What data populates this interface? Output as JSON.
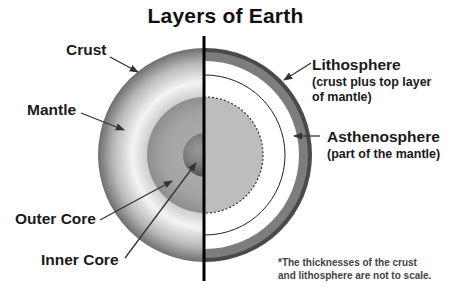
{
  "title": "Layers of Earth",
  "left_labels": {
    "crust": "Crust",
    "mantle": "Mantle",
    "outer_core": "Outer Core",
    "inner_core": "Inner Core"
  },
  "right_labels": {
    "lithosphere": {
      "name": "Lithosphere",
      "desc_line1": "(crust plus top layer",
      "desc_line2": "of mantle)"
    },
    "asthenosphere": {
      "name": "Asthenosphere",
      "desc": "(part of the mantle)"
    }
  },
  "footnote": {
    "line1": "*The thicknesses of the crust",
    "line2": "and lithosphere are not to scale."
  },
  "colors": {
    "background": "#ffffff",
    "text": "#1a1a1a",
    "divider": "#000000",
    "mantle_light": "#f2f2f2",
    "mantle_dark": "#6a6a6a",
    "outer_core": "#a6a6a6",
    "inner_core": "#7a7a7a",
    "lithosphere_band": "#7d7d7d",
    "crust_rim": "#4a4a4a",
    "right_core_fill": "#bcbcbc"
  }
}
